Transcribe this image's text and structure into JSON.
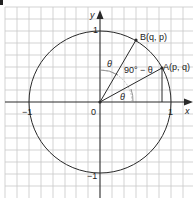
{
  "diagram": {
    "type": "unit-circle",
    "axes": {
      "x_label": "x",
      "y_label": "y",
      "origin_label": "0",
      "ticks": {
        "x_pos": "1",
        "x_neg": "−1",
        "y_pos": "1",
        "y_neg": "−1"
      }
    },
    "points": {
      "A": {
        "label": "A(p, q)"
      },
      "B": {
        "label": "B(q, p)"
      }
    },
    "angles": {
      "theta_from_x": "θ",
      "theta_from_y": "θ",
      "complement": "90° − θ"
    },
    "colors": {
      "grid": "#c8c8c8",
      "line": "#2a2a2a",
      "arc": "#777777",
      "background": "#ffffff"
    }
  }
}
